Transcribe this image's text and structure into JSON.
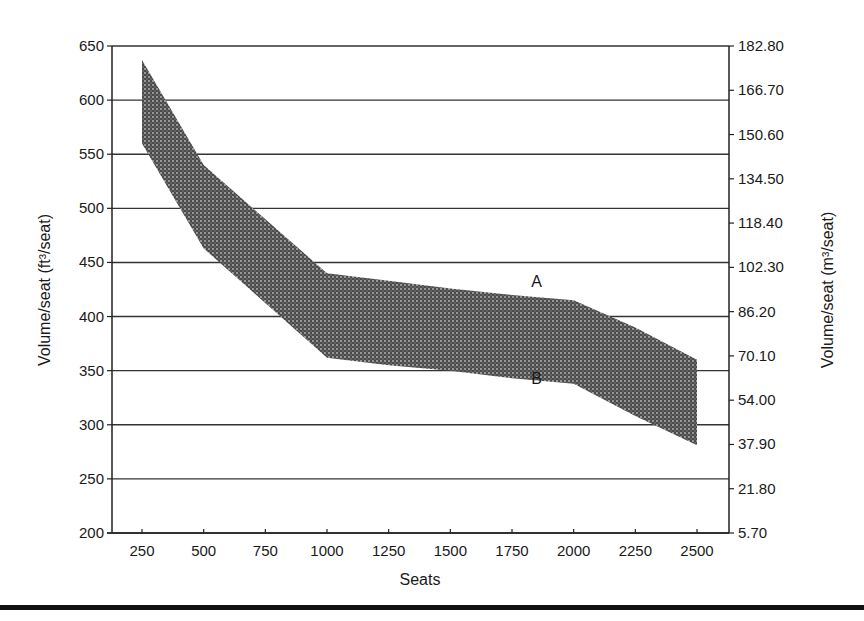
{
  "chart_data": {
    "type": "area",
    "subtype": "band",
    "title": "",
    "xlabel": "Seats",
    "ylabel": "Volume/seat (ft³/seat)",
    "ylabel_right": "Volume/seat (m³/seat)",
    "x": [
      250,
      500,
      1000,
      2000,
      2500
    ],
    "series": [
      {
        "name": "A",
        "role": "upper bound",
        "values": [
          637,
          540,
          440,
          415,
          360
        ]
      },
      {
        "name": "B",
        "role": "lower bound",
        "values": [
          560,
          463,
          362,
          338,
          281
        ]
      }
    ],
    "band_points": {
      "upper": [
        [
          250,
          637
        ],
        [
          500,
          540
        ],
        [
          1000,
          440
        ],
        [
          1250,
          433
        ],
        [
          1500,
          426
        ],
        [
          1750,
          420
        ],
        [
          2000,
          415
        ],
        [
          2250,
          390
        ],
        [
          2500,
          360
        ]
      ],
      "lower": [
        [
          250,
          560
        ],
        [
          500,
          463
        ],
        [
          1000,
          362
        ],
        [
          1250,
          355
        ],
        [
          1500,
          350
        ],
        [
          1750,
          343
        ],
        [
          2000,
          338
        ],
        [
          2250,
          308
        ],
        [
          2500,
          281
        ]
      ]
    },
    "xlim": [
      130,
      2630
    ],
    "ylim": [
      200,
      650
    ],
    "x_ticks": [
      "250",
      "500",
      "750",
      "1000",
      "1250",
      "1500",
      "1750",
      "2000",
      "2250",
      "2500"
    ],
    "y_ticks": [
      "650",
      "600",
      "550",
      "500",
      "450",
      "400",
      "350",
      "300",
      "250",
      "200"
    ],
    "y_ticks_right": [
      "182.80",
      "166.70",
      "150.60",
      "134.50",
      "118.40",
      "102.30",
      "86.20",
      "70.10",
      "54.00",
      "37.90",
      "21.80",
      "5.70"
    ],
    "annotations": [
      {
        "text": "A",
        "x": 1850,
        "y": 432
      },
      {
        "text": "B",
        "x": 1850,
        "y": 342
      }
    ],
    "grid": {
      "horizontal": true,
      "vertical": false
    },
    "legend": "none",
    "fill": "stippled dark gray",
    "colors": {
      "band": "#5a5a5a",
      "grid": "#333333",
      "axis": "#222222"
    }
  }
}
